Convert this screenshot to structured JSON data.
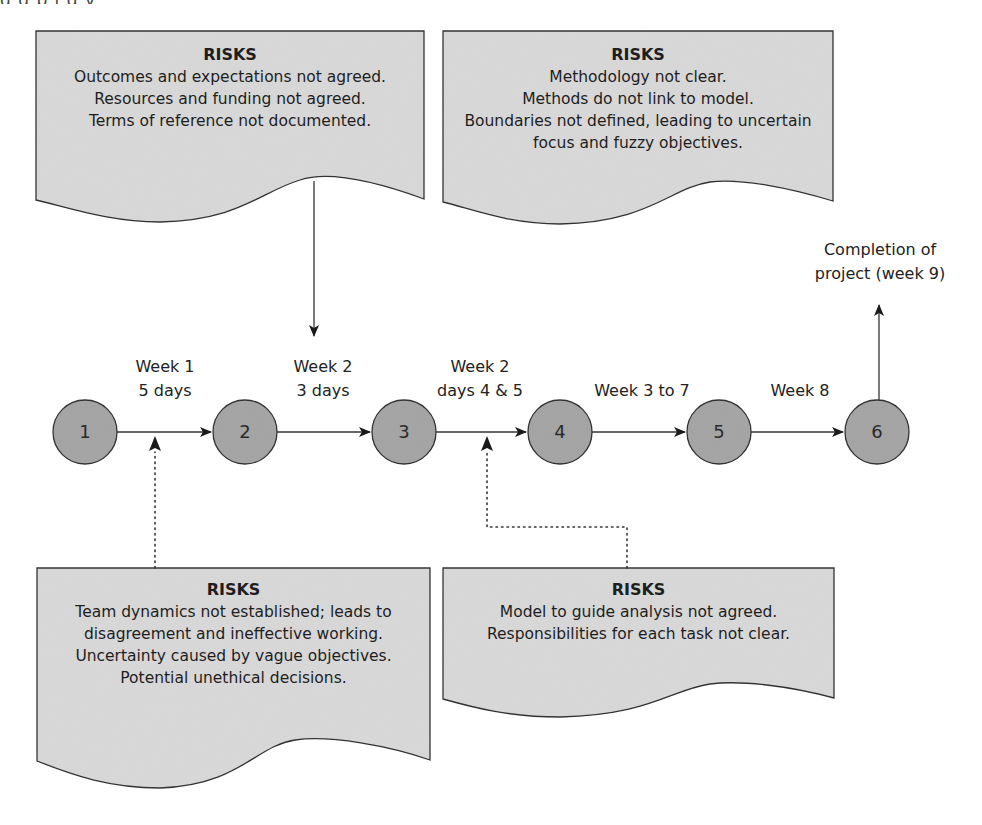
{
  "header": {
    "cut_off_text": "g                g                          p  j       g          y"
  },
  "risk_boxes": [
    {
      "id": "top-left",
      "title": "RISKS",
      "lines": [
        "Outcomes and expectations not agreed.",
        "Resources and funding not agreed.",
        "Terms of reference not documented."
      ]
    },
    {
      "id": "top-right",
      "title": "RISKS",
      "lines": [
        "Methodology not clear.",
        "Methods do not link to model.",
        "Boundaries not defined, leading to uncertain",
        "focus and fuzzy objectives."
      ]
    },
    {
      "id": "bottom-left",
      "title": "RISKS",
      "lines": [
        "Team dynamics not established; leads to",
        "disagreement and ineffective working.",
        "Uncertainty caused by vague objectives.",
        "Potential unethical decisions."
      ]
    },
    {
      "id": "bottom-right",
      "title": "RISKS",
      "lines": [
        "Model to guide analysis not agreed.",
        "Responsibilities for each task not clear."
      ]
    }
  ],
  "nodes": [
    {
      "label": "1"
    },
    {
      "label": "2"
    },
    {
      "label": "3"
    },
    {
      "label": "4"
    },
    {
      "label": "5"
    },
    {
      "label": "6"
    }
  ],
  "edges": [
    {
      "from": "1",
      "to": "2",
      "line1": "Week 1",
      "line2": "5 days"
    },
    {
      "from": "2",
      "to": "3",
      "line1": "Week 2",
      "line2": "3 days"
    },
    {
      "from": "3",
      "to": "4",
      "line1": "Week 2",
      "line2": "days 4 & 5"
    },
    {
      "from": "4",
      "to": "5",
      "line1": "",
      "line2": "Week 3 to 7"
    },
    {
      "from": "5",
      "to": "6",
      "line1": "",
      "line2": "Week 8"
    }
  ],
  "completion": {
    "line1": "Completion of",
    "line2": "project (week 9)"
  },
  "colors": {
    "box_fill": "#d9d9d9",
    "node_fill": "#a6a6a6",
    "stroke": "#333333"
  }
}
